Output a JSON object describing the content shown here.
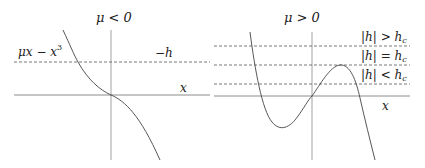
{
  "panels": [
    {
      "id": "mu-negative",
      "title": "μ < 0",
      "curve_label": "μx − x",
      "curve_label_exp": "3",
      "dashed_label": "−h",
      "x_axis_label": "x"
    },
    {
      "id": "mu-positive",
      "title": "μ > 0",
      "dashed_labels": [
        "|h| > h",
        "|h| = h",
        "|h| < h"
      ],
      "dashed_label_sub": "c",
      "x_axis_label": "x"
    }
  ],
  "colors": {
    "axis": "#6f6f6f",
    "curve": "#444444",
    "dashed": "#555555",
    "text": "#222222"
  }
}
